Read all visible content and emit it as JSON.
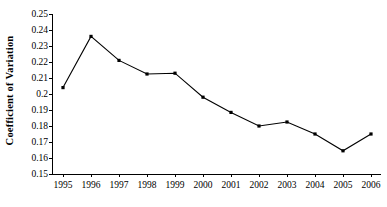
{
  "chart_data": {
    "type": "line",
    "title": "",
    "subtitle": "",
    "xlabel": "",
    "ylabel": "Coefficient of  Variation",
    "categories": [
      "1995",
      "1996",
      "1997",
      "1998",
      "1999",
      "2000",
      "2001",
      "2002",
      "2003",
      "2004",
      "2005",
      "2006"
    ],
    "x": [
      1995,
      1996,
      1997,
      1998,
      1999,
      2000,
      2001,
      2002,
      2003,
      2004,
      2005,
      2006
    ],
    "values": [
      0.204,
      0.236,
      0.221,
      0.2125,
      0.213,
      0.198,
      0.1885,
      0.18,
      0.1825,
      0.175,
      0.1645,
      0.175
    ],
    "ylim": [
      0.15,
      0.25
    ],
    "ytick_labels": [
      "0.25",
      "0.24",
      "0.23",
      "0.22",
      "0.21",
      "0.2",
      "0.19",
      "0.18",
      "0.17",
      "0.16",
      "0.15"
    ],
    "ytick_values": [
      0.25,
      0.24,
      0.23,
      0.22,
      0.21,
      0.2,
      0.19,
      0.18,
      0.17,
      0.16,
      0.15
    ],
    "grid": false,
    "legend": false,
    "legend_position": "none",
    "series": [
      {
        "name": "Coefficient of Variation",
        "values": [
          0.204,
          0.236,
          0.221,
          0.2125,
          0.213,
          0.198,
          0.1885,
          0.18,
          0.1825,
          0.175,
          0.1645,
          0.175
        ],
        "color": "#000000",
        "marker": "square",
        "line_style": "solid"
      }
    ]
  },
  "style": {
    "line_color": "#000000",
    "marker_color": "#000000",
    "axis_color": "#000000",
    "background": "#ffffff"
  }
}
